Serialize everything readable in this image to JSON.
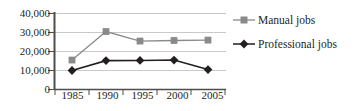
{
  "chart_data": {
    "type": "line",
    "title": "",
    "subtitle": "",
    "xlabel": "",
    "ylabel": "",
    "categories": [
      "1985",
      "1990",
      "1995",
      "2000",
      "2005"
    ],
    "x": [
      1985,
      1990,
      1995,
      2000,
      2005
    ],
    "ylim": [
      0,
      40000
    ],
    "ytick_values": [
      40000,
      30000,
      20000,
      10000,
      0
    ],
    "ytick_labels": [
      "40,000",
      "30,000",
      "20,000",
      "10,000",
      "0"
    ],
    "grid": true,
    "grid_axis": "y",
    "legend_position": "right",
    "series": [
      {
        "name": "Manual jobs",
        "values": [
          15500,
          30500,
          25500,
          25800,
          26000
        ],
        "color": "#8a8a8a",
        "marker": "square"
      },
      {
        "name": "Professional jobs",
        "values": [
          10000,
          15200,
          15300,
          15500,
          10500
        ],
        "color": "#231f20",
        "marker": "diamond"
      }
    ]
  },
  "legend": {
    "items": [
      {
        "label": "Manual jobs",
        "marker_name": "legend-marker-square",
        "color": "#8a8a8a"
      },
      {
        "label": "Professional jobs",
        "marker_name": "legend-marker-diamond",
        "color": "#231f20"
      }
    ]
  },
  "axes": {
    "y_labels": [
      "40,000",
      "30,000",
      "20,000",
      "10,000",
      "0"
    ],
    "x_labels": [
      "1985",
      "1990",
      "1995",
      "2000",
      "2005"
    ]
  },
  "colors": {
    "background": "#ffffff",
    "axis": "#4d4d4d",
    "grid": "#c9c9c9",
    "text": "#231f20",
    "series_manual": "#8a8a8a",
    "series_professional": "#231f20"
  }
}
